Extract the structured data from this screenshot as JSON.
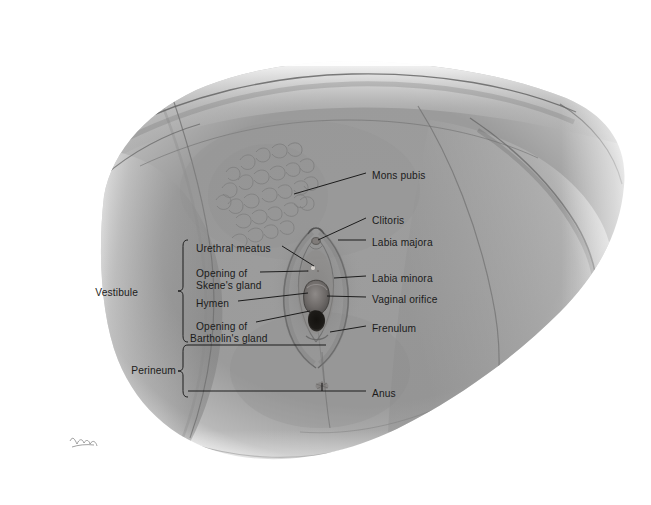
{
  "figure": {
    "type": "anatomical-illustration",
    "medium": "graphite pencil drawing",
    "background_color": "#ffffff",
    "body_tone_color": "#9c9c9c",
    "line_color": "#151515",
    "label_text_color": "#1b1b1b",
    "artist_signature": "illegible cursive initials"
  },
  "labels_right": [
    {
      "id": "mons-pubis",
      "text": "Mons pubis",
      "x": 372,
      "y": 176
    },
    {
      "id": "clitoris",
      "text": "Clitoris",
      "x": 372,
      "y": 221
    },
    {
      "id": "labia-majora",
      "text": "Labia majora",
      "x": 372,
      "y": 243
    },
    {
      "id": "labia-minora",
      "text": "Labia minora",
      "x": 372,
      "y": 279
    },
    {
      "id": "vaginal-orifice",
      "text": "Vaginal orifice",
      "x": 372,
      "y": 300
    },
    {
      "id": "frenulum",
      "text": "Frenulum",
      "x": 372,
      "y": 329
    },
    {
      "id": "anus",
      "text": "Anus",
      "x": 372,
      "y": 394
    }
  ],
  "labels_left": [
    {
      "id": "urethral-meatus",
      "line1": "Urethral meatus",
      "line2": "",
      "x": 196,
      "y": 249
    },
    {
      "id": "opening-of-skenes-gland",
      "line1": "Opening of",
      "line2": "Skene's gland",
      "x": 196,
      "y": 275
    },
    {
      "id": "hymen",
      "line1": "Hymen",
      "line2": "",
      "x": 196,
      "y": 304
    },
    {
      "id": "opening-of-bartholins-gland",
      "line1": "Opening of",
      "line2": "Bartholin's gland",
      "x": 196,
      "y": 328
    }
  ],
  "group_labels": [
    {
      "id": "vestibule",
      "text": "Vestibule",
      "x": 140,
      "y": 293
    },
    {
      "id": "perineum",
      "text": "Perineum",
      "x": 140,
      "y": 371
    }
  ],
  "caption": {
    "text": ""
  }
}
